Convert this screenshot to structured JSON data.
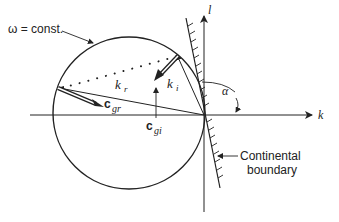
{
  "diagram": {
    "labels": {
      "omega": "ω = const.",
      "l_axis": "l",
      "k_axis": "k",
      "alpha": "α",
      "k_r": "k",
      "k_r_sub": "r",
      "k_i": "k",
      "k_i_sub": "i",
      "c_gr": "c",
      "c_gr_sub": "gr",
      "c_gi": "c",
      "c_gi_sub": "gi",
      "boundary_line1": "Continental",
      "boundary_line2": "boundary"
    },
    "colors": {
      "ink": "#222222",
      "background": "#ffffff"
    }
  }
}
